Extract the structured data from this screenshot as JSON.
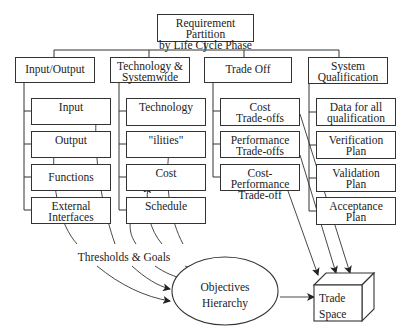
{
  "root": {
    "label": "Requirement Partition\nby Life Cycle Phase"
  },
  "categories": [
    {
      "label": "Input/Output",
      "children": [
        "Input",
        "Output",
        "Functions",
        "External\nInterfaces"
      ]
    },
    {
      "label": "Technology &\nSystemwide",
      "children": [
        "Technology",
        "\"ilities\"",
        "Cost",
        "Schedule"
      ]
    },
    {
      "label": "Trade Off",
      "children": [
        "Cost\nTrade-offs",
        "Performance\nTrade-offs",
        "Cost-Performance\nTrade-off"
      ]
    },
    {
      "label": "System\nQualification",
      "children": [
        "Data for all\nqualification",
        "Verification\nPlan",
        "Validation\nPlan",
        "Acceptance\nPlan"
      ]
    }
  ],
  "thresholds": {
    "label": "Thresholds & Goals"
  },
  "objectives": {
    "label": "Objectives\nHierarchy"
  },
  "trade_space": {
    "label": "Trade\nSpace"
  },
  "colors": {
    "line": "#333333",
    "background": "#ffffff"
  }
}
